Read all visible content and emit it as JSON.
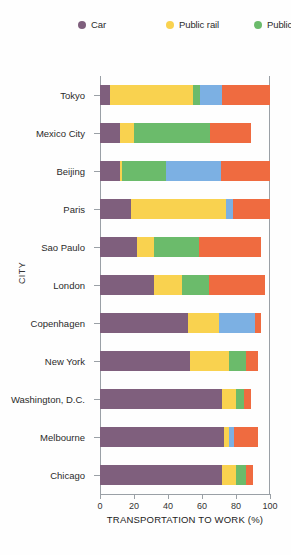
{
  "chart_data": {
    "type": "bar",
    "orientation": "horizontal",
    "stacked": true,
    "title": "",
    "xlabel": "TRANSPORTATION TO WORK (%)",
    "ylabel": "CITY",
    "xlim": [
      0,
      100
    ],
    "xticks": [
      0,
      20,
      40,
      60,
      80,
      100
    ],
    "grid": false,
    "legend_position": "top",
    "categories": [
      "Tokyo",
      "Mexico City",
      "Beijing",
      "Paris",
      "Sao Paulo",
      "London",
      "Copenhagen",
      "New York",
      "Washington, D.C.",
      "Melbourne",
      "Chicago"
    ],
    "series": [
      {
        "name": "Car",
        "color": "#7f5f7d",
        "values": [
          6,
          12,
          12,
          18,
          22,
          32,
          52,
          53,
          72,
          73,
          72
        ]
      },
      {
        "name": "Public rail",
        "color": "#f9d24f",
        "values": [
          49,
          8,
          1,
          56,
          10,
          16,
          18,
          23,
          8,
          3,
          8
        ]
      },
      {
        "name": "Public bus",
        "color": "#6bbb6b",
        "values": [
          4,
          45,
          26,
          0,
          26,
          16,
          0,
          10,
          5,
          0,
          6
        ]
      },
      {
        "name": "Bicycle",
        "color": "#7cb0e3",
        "values": [
          13,
          0,
          32,
          4,
          0,
          0,
          21,
          0,
          0,
          3,
          0
        ]
      },
      {
        "name": "Foot",
        "color": "#ef6b40",
        "values": [
          28,
          24,
          29,
          22,
          37,
          33,
          4,
          7,
          4,
          14,
          4
        ]
      }
    ],
    "legend_entries": [
      {
        "label": "Car",
        "color": "#7f5f7d"
      },
      {
        "label": "Public rail",
        "color": "#f9d24f"
      },
      {
        "label": "Public bus",
        "color": "#6bbb6b"
      },
      {
        "label": "Bicycle",
        "color": "#7cb0e3"
      },
      {
        "label": "Foot",
        "color": "#ef6b40"
      }
    ]
  }
}
